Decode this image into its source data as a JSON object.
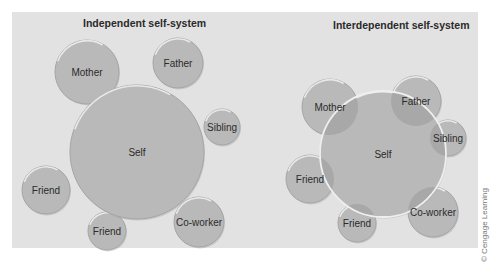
{
  "diagrams": [
    {
      "title": "Independent self-system",
      "nodes": [
        {
          "label": "Self",
          "cx": 137,
          "cy": 152,
          "r": 67,
          "role": "self"
        },
        {
          "label": "Mother",
          "cx": 87,
          "cy": 72,
          "r": 32
        },
        {
          "label": "Father",
          "cx": 178,
          "cy": 63,
          "r": 25
        },
        {
          "label": "Sibling",
          "cx": 222,
          "cy": 127,
          "r": 18
        },
        {
          "label": "Friend",
          "cx": 46,
          "cy": 190,
          "r": 24
        },
        {
          "label": "Friend",
          "cx": 107,
          "cy": 231,
          "r": 19
        },
        {
          "label": "Co-worker",
          "cx": 199,
          "cy": 222,
          "r": 25
        }
      ],
      "overlapping": false
    },
    {
      "title": "Interdependent self-system",
      "nodes": [
        {
          "label": "Self",
          "cx": 383,
          "cy": 154,
          "r": 63,
          "role": "self"
        },
        {
          "label": "Mother",
          "cx": 330,
          "cy": 107,
          "r": 28
        },
        {
          "label": "Father",
          "cx": 416,
          "cy": 101,
          "r": 25
        },
        {
          "label": "Sibling",
          "cx": 448,
          "cy": 138,
          "r": 18
        },
        {
          "label": "Friend",
          "cx": 310,
          "cy": 179,
          "r": 24
        },
        {
          "label": "Friend",
          "cx": 357,
          "cy": 223,
          "r": 19
        },
        {
          "label": "Co-worker",
          "cx": 433,
          "cy": 212,
          "r": 25
        }
      ],
      "overlapping": true
    }
  ],
  "credit": "© Cengage Learning",
  "colors": {
    "panel_bg": "#e2e2e2",
    "circle_fill": "#b9b9b9",
    "circle_edge": "#a5a5a5",
    "highlight": "#f2f2f2",
    "overlap_fill": "#a8a8a8"
  }
}
